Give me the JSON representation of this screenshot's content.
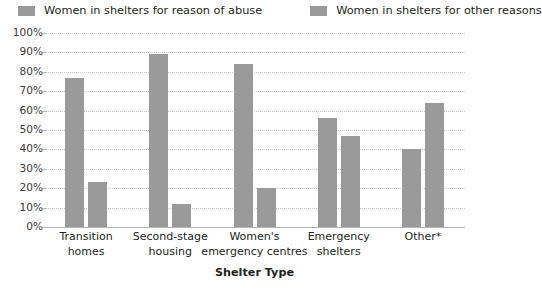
{
  "legend": {
    "entries": [
      {
        "label": "Women in shelters for reason of abuse",
        "color": "#9a9a9a",
        "swatch_icon": "legend-swatch-icon"
      },
      {
        "label": "Women in shelters for other reasons",
        "color": "#9a9a9a",
        "swatch_icon": "legend-swatch-icon"
      }
    ]
  },
  "axis": {
    "y_ticks": [
      "100%",
      "90%",
      "80%",
      "70%",
      "60%",
      "50%",
      "40%",
      "30%",
      "20%",
      "10%",
      "0%"
    ],
    "x_title": "Shelter Type"
  },
  "chart_data": {
    "type": "bar",
    "title": "",
    "xlabel": "Shelter Type",
    "ylabel": "",
    "ylim": [
      0,
      100
    ],
    "ytick_values": [
      0,
      10,
      20,
      30,
      40,
      50,
      60,
      70,
      80,
      90,
      100
    ],
    "ytick_labels": [
      "0%",
      "10%",
      "20%",
      "30%",
      "40%",
      "50%",
      "60%",
      "70%",
      "80%",
      "90%",
      "100%"
    ],
    "grid": true,
    "grid_axis": "y",
    "legend_position": "top",
    "bar_color": "#9a9a9a",
    "categories": [
      "Transition homes",
      "Second-stage housing",
      "Women's emergency centres",
      "Emergency shelters",
      "Other*"
    ],
    "category_lines": [
      [
        "Transition",
        "homes"
      ],
      [
        "Second-stage",
        "housing"
      ],
      [
        "Women's",
        "emergency centres"
      ],
      [
        "Emergency",
        "shelters"
      ],
      [
        "Other*",
        ""
      ]
    ],
    "series": [
      {
        "name": "Women in shelters for reason of abuse",
        "color": "#9a9a9a",
        "values": [
          77,
          89,
          84,
          56,
          40
        ]
      },
      {
        "name": "Women in shelters for other reasons",
        "color": "#9a9a9a",
        "values": [
          23,
          12,
          20,
          47,
          64
        ]
      }
    ]
  }
}
